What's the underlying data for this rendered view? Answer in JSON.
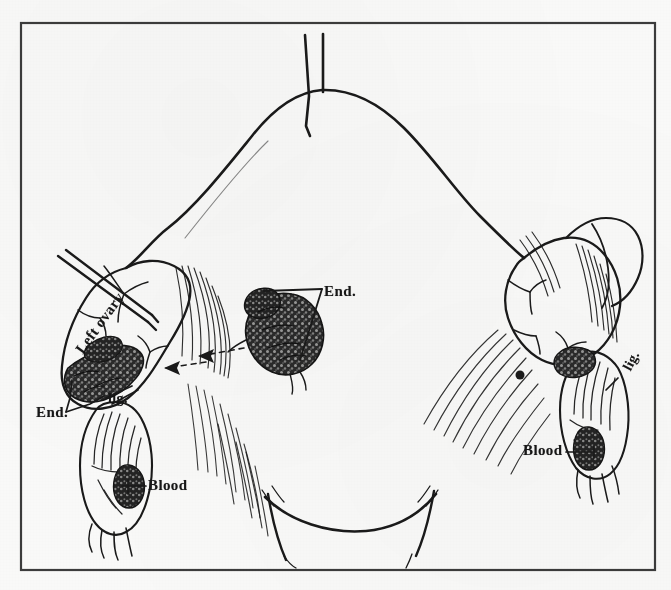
{
  "figure": {
    "kind": "anatomical-line-drawing",
    "medium": "pen-and-ink scan on aged paper",
    "background_color": "#fbfbfa",
    "ink_color": "#1a1a1a",
    "border_color": "#3a3a3a"
  },
  "frame": {
    "x": 20,
    "y": 22,
    "width": 636,
    "height": 549,
    "stroke_width": 2
  },
  "labels": [
    {
      "id": "end-left",
      "text": "End.",
      "rotation": 0,
      "side": "left",
      "x": 36,
      "y": 404
    },
    {
      "id": "lig-left",
      "text": "lig.",
      "rotation": 0,
      "side": "left",
      "x": 108,
      "y": 391
    },
    {
      "id": "blood-left",
      "text": "Blood",
      "rotation": 0,
      "side": "left",
      "x": 148,
      "y": 477
    },
    {
      "id": "ovary-left",
      "text": "Left ovary",
      "rotation": -54,
      "side": "left",
      "x": 86,
      "y": 340
    },
    {
      "id": "end-center",
      "text": "End.",
      "rotation": 0,
      "side": "center",
      "x": 324,
      "y": 283
    },
    {
      "id": "lig-right",
      "text": "lig.",
      "rotation": -62,
      "side": "right",
      "x": 620,
      "y": 366
    },
    {
      "id": "blood-right",
      "text": "Blood",
      "rotation": 0,
      "side": "right",
      "x": 523,
      "y": 442
    }
  ],
  "annotations": {
    "leader_lines": 6,
    "dashed_arrows": 2,
    "suture_threads": 2,
    "probe_instruments": 1
  },
  "structures": [
    {
      "id": "uterine-fundus",
      "label": "uterine fundus / corpus"
    },
    {
      "id": "left-ovary",
      "label": "left ovary"
    },
    {
      "id": "right-ovary",
      "label": "right ovary"
    },
    {
      "id": "left-adnexa",
      "label": "left adnexal mass"
    },
    {
      "id": "right-adnexa",
      "label": "right adnexal mass"
    },
    {
      "id": "endometriosis-implant-center",
      "label": "endometriotic implant (center)"
    },
    {
      "id": "cervix",
      "label": "cervix / lower segment"
    }
  ]
}
